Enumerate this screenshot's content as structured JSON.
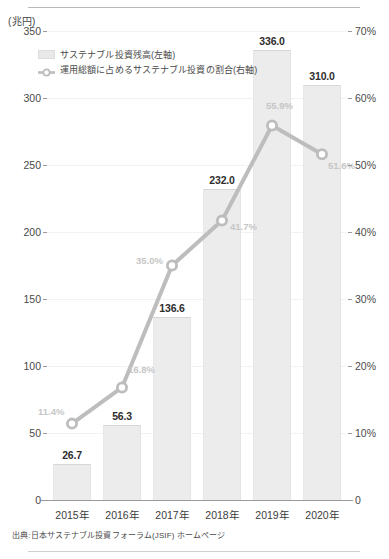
{
  "chart_data": {
    "type": "bar",
    "title": "",
    "unit_label": "(兆円)",
    "categories": [
      "2015年",
      "2016年",
      "2017年",
      "2018年",
      "2019年",
      "2020年"
    ],
    "xlabel": "",
    "ylabel_left": "(兆円)",
    "ylabel_right": "%",
    "ylim_left": [
      0,
      350
    ],
    "ylim_right": [
      0,
      70
    ],
    "yticks_left": [
      "0",
      "50",
      "100",
      "150",
      "200",
      "250",
      "300",
      "350"
    ],
    "yticks_right": [
      "0",
      "10%",
      "20%",
      "30%",
      "40%",
      "50%",
      "60%",
      "70%"
    ],
    "grid": true,
    "legend_position": "top-left",
    "series": [
      {
        "name": "サステナブル投資残高(左軸)",
        "type": "bar",
        "axis": "left",
        "values": [
          26.7,
          56.3,
          136.6,
          232.0,
          336.0,
          310.0
        ],
        "labels": [
          "26.7",
          "56.3",
          "136.6",
          "232.0",
          "336.0",
          "310.0"
        ],
        "color": "#ececec"
      },
      {
        "name": "運用総額に占めるサステナブル投資の割合(右軸)",
        "type": "line",
        "axis": "right",
        "values": [
          11.4,
          16.8,
          35.0,
          41.7,
          55.9,
          51.6
        ],
        "labels": [
          "11.4%",
          "16.8%",
          "35.0%",
          "41.7%",
          "55.9%",
          "51.6%"
        ],
        "color": "#bdbdbd"
      }
    ],
    "source_note": "出典:日本サステナブル投資フォーラム(JSIF) ホームページ"
  },
  "legend": {
    "items": [
      {
        "label": "サステナブル投資残高(左軸)",
        "marker": "bar-swatch-icon"
      },
      {
        "label": "運用総額に占めるサステナブル投資の割合(右軸)",
        "marker": "line-marker-icon"
      }
    ]
  },
  "colors": {
    "bar_fill": "#ececec",
    "bar_edge": "#d7d7d7",
    "line": "#bdbdbd",
    "pct_label": "#c6c6c6",
    "axis": "#9b9b9b",
    "grid": "#f2f2f2",
    "text": "#3a3a3a"
  }
}
